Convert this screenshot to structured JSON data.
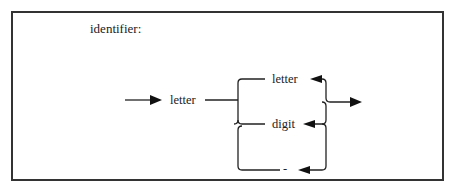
{
  "diagram": {
    "title": "identifier:",
    "type": "syntax-diagram",
    "entry_node": "letter",
    "loop_nodes": [
      {
        "label": "letter"
      },
      {
        "label": "digit"
      },
      {
        "label": "-"
      }
    ],
    "colors": {
      "line": "#222222",
      "border": "#333333",
      "background": "#ffffff"
    }
  }
}
